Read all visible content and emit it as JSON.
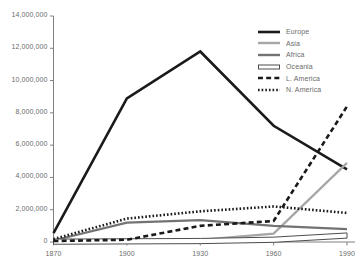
{
  "chart_data": {
    "type": "line",
    "title": "",
    "subtitle": "",
    "xlabel": "",
    "ylabel": "",
    "x": [
      1870,
      1900,
      1930,
      1960,
      1990
    ],
    "categories": [
      "1870",
      "1900",
      "1930",
      "1960",
      "1990"
    ],
    "xlim": [
      1870,
      1990
    ],
    "ylim": [
      0,
      14000000
    ],
    "ytick_values": [
      0,
      2000000,
      4000000,
      6000000,
      8000000,
      10000000,
      12000000,
      14000000
    ],
    "ytick_labels": [
      "0",
      "2,000,000",
      "4,000,000",
      "6,000,000",
      "8,000,000",
      "10,000,000",
      "12,000,000",
      "14,000,000"
    ],
    "xtick_labels": [
      "1870",
      "1900",
      "1930",
      "1960",
      "1990"
    ],
    "grid": false,
    "legend_position": "top-right",
    "series": [
      {
        "name": "Europe",
        "values": [
          550000,
          8900000,
          11800000,
          7200000,
          4500000
        ],
        "color": "#1a1a1a",
        "style": "solid",
        "width": 2.6
      },
      {
        "name": "Asia",
        "values": [
          70000,
          120000,
          130000,
          520000,
          4900000
        ],
        "color": "#a6a6a6",
        "style": "solid",
        "width": 2.2
      },
      {
        "name": "Africa",
        "values": [
          90000,
          1200000,
          1350000,
          1000000,
          800000
        ],
        "color": "#737373",
        "style": "solid",
        "width": 2.2
      },
      {
        "name": "Oceania",
        "values": [
          20000,
          40000,
          60000,
          140000,
          400000
        ],
        "color": "#4d4d4d",
        "style": "hollow",
        "width": 1.0
      },
      {
        "name": "L. America",
        "values": [
          60000,
          140000,
          1000000,
          1300000,
          8400000
        ],
        "color": "#1a1a1a",
        "style": "dashed",
        "width": 2.6
      },
      {
        "name": "N. America",
        "values": [
          180000,
          1450000,
          1900000,
          2200000,
          1800000
        ],
        "color": "#1a1a1a",
        "style": "dotted",
        "width": 2.6
      }
    ]
  },
  "axis": {
    "line_color": "#808080",
    "tick_color": "#808080"
  },
  "legend": {
    "items": [
      {
        "label": "Europe"
      },
      {
        "label": "Asia"
      },
      {
        "label": "Africa"
      },
      {
        "label": "Oceania"
      },
      {
        "label": "L. America"
      },
      {
        "label": "N. America"
      }
    ]
  }
}
